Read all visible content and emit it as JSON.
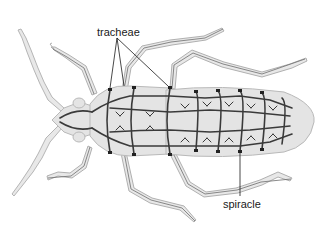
{
  "diagram": {
    "labels": {
      "tracheae": "tracheae",
      "spiracle": "spiracle"
    },
    "colors": {
      "background": "#ffffff",
      "body_fill": "#e4e4e4",
      "body_outline": "#b9b9b9",
      "trachea_stroke": "#3a3a3a",
      "leg_fill": "#e8e8e8",
      "leg_outline": "#b5b5b5",
      "leader_line": "#1a1a1a",
      "label_text": "#1a1a1a"
    }
  }
}
